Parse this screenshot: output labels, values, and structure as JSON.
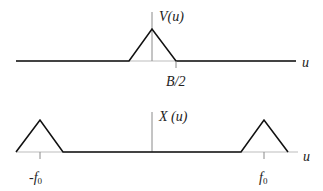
{
  "top_plot": {
    "function_label": "V(u)",
    "axis_label": "u",
    "tick_label": "B/2",
    "shape": "triangle centered at 0 spanning -B/2 to B/2"
  },
  "bottom_plot": {
    "function_label": "X (u)",
    "axis_label": "u",
    "tick_left_main": "-f",
    "tick_left_sub": "0",
    "tick_right_main": "f",
    "tick_right_sub": "0",
    "shape": "two triangles centered at -f0 and f0"
  },
  "colors": {
    "curve": "#111111",
    "axis": "#9a9a9a",
    "text": "#222222"
  }
}
